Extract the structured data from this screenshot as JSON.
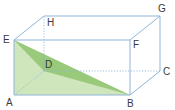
{
  "diagram": {
    "type": "cuboid",
    "colors": {
      "edge": "#8db5d9",
      "face_light": "#cfe5bb",
      "face_dark": "#8fc46f",
      "label": "#3a3a3a",
      "background": "#ffffff"
    },
    "vertices": {
      "A": {
        "label": "A",
        "x": 14,
        "y": 95
      },
      "B": {
        "label": "B",
        "x": 130,
        "y": 95
      },
      "C": {
        "label": "C",
        "x": 160,
        "y": 71
      },
      "D": {
        "label": "D",
        "x": 44,
        "y": 71
      },
      "E": {
        "label": "E",
        "x": 14,
        "y": 40
      },
      "F": {
        "label": "F",
        "x": 130,
        "y": 40
      },
      "G": {
        "label": "G",
        "x": 160,
        "y": 16
      },
      "H": {
        "label": "H",
        "x": 44,
        "y": 16
      }
    },
    "visible_edges": [
      "AB",
      "BF",
      "FE",
      "EA",
      "EH",
      "HG",
      "FG",
      "GC",
      "BC"
    ],
    "hidden_edges": [
      "AD",
      "DC",
      "DH"
    ],
    "shaded_regions": [
      {
        "name": "triangle-AEB-region",
        "vertices": [
          "E",
          "A",
          "B"
        ],
        "shade": "light"
      },
      {
        "name": "triangle-EDB",
        "vertices": [
          "E",
          "D",
          "B"
        ],
        "shade": "dark"
      }
    ]
  }
}
